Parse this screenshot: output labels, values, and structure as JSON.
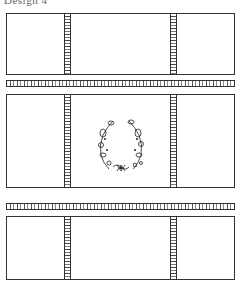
{
  "title": "Design 4",
  "panels": [
    {
      "id": "top",
      "top": 13,
      "height": 62,
      "ornament": false
    },
    {
      "id": "middle",
      "top": 94,
      "height": 94,
      "ornament": true,
      "ornament_name": "floral-wreath"
    },
    {
      "id": "bottom",
      "top": 216,
      "height": 64,
      "ornament": false
    }
  ],
  "border_strips": [
    {
      "top": 80
    },
    {
      "top": 203
    }
  ],
  "vertical_strips_x": [
    64,
    170
  ],
  "colors": {
    "line": "#333333",
    "background": "#ffffff"
  }
}
